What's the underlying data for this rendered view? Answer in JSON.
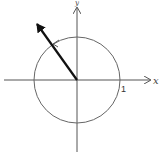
{
  "diagram": {
    "type": "unit-circle",
    "axes": {
      "x_label": "x",
      "y_label": "y",
      "tick_label": "1"
    },
    "circle": {
      "center": [
        77,
        80
      ],
      "radius": 43
    },
    "vector": {
      "from": [
        77,
        80
      ],
      "to": [
        35,
        21
      ],
      "quadrant": "II"
    },
    "arc_direction_marker": "counter-clockwise",
    "colors": {
      "axis": "#555555",
      "circle": "#666666",
      "vector": "#111111"
    }
  }
}
